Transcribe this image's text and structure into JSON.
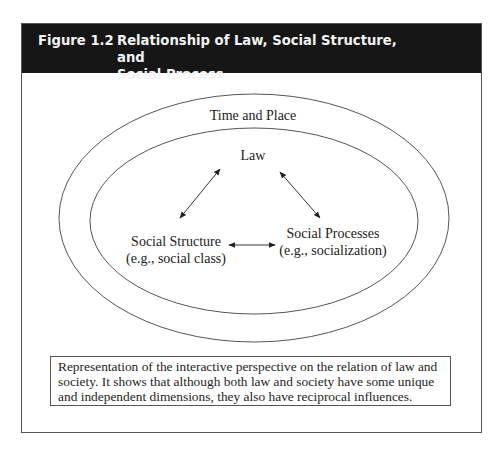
{
  "figure": {
    "number": "Figure 1.2",
    "title": "Relationship of Law, Social Structure, and Social Process",
    "title_line1": "Relationship of Law, Social Structure, and",
    "title_line2": "Social Process",
    "header_bg": "#161616",
    "header_fg": "#f2f2f2"
  },
  "diagram": {
    "outer_ellipse": {
      "label": "Time and Place",
      "cx": 254,
      "cy": 218,
      "rx": 195,
      "ry": 124
    },
    "inner_ellipse": {
      "cx": 254,
      "cy": 221,
      "rx": 164,
      "ry": 93
    },
    "nodes": {
      "law": {
        "label": "Law"
      },
      "social_structure": {
        "label": "Social Structure",
        "sublabel": "(e.g., social class)"
      },
      "social_processes": {
        "label": "Social Processes",
        "sublabel": "(e.g., socialization)"
      }
    },
    "edges": [
      {
        "from": "law",
        "to": "social_structure",
        "type": "bidirectional"
      },
      {
        "from": "law",
        "to": "social_processes",
        "type": "bidirectional"
      },
      {
        "from": "social_structure",
        "to": "social_processes",
        "type": "bidirectional"
      }
    ],
    "line_color": "#555555",
    "arrow_color": "#222222"
  },
  "caption": {
    "text": "Representation of the interactive perspective on the relation of law and society. It shows that although both law and society have some unique and independent dimensions, they also have reciprocal influences."
  }
}
